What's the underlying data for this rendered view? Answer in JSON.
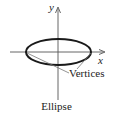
{
  "figure": {
    "caption": "Ellipse",
    "axes": {
      "x_label": "x",
      "y_label": "y"
    },
    "annotation": "Vertices",
    "shape": "ellipse",
    "colors": {
      "stroke": "#1a1a1a",
      "axis": "#555555",
      "leader": "#777777",
      "background": "#ffffff"
    }
  }
}
